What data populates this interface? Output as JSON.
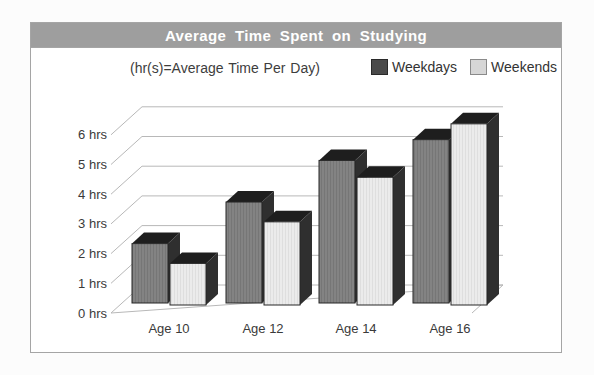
{
  "page": {
    "title_bar": "Average Time Spent on Studying",
    "subtitle": "(hr(s)=Average Time Per Day)"
  },
  "legend": {
    "items": [
      {
        "label": "Weekdays",
        "swatch_color": "#4a4a4a"
      },
      {
        "label": "Weekends",
        "swatch_color": "#d6d6d6"
      }
    ]
  },
  "chart_data": {
    "type": "bar",
    "projection": "pseudo-3d",
    "title": "Average Time Spent on Studying",
    "subtitle": "(hr(s)=Average Time Per Day)",
    "categories": [
      "Age 10",
      "Age 12",
      "Age 14",
      "Age 16"
    ],
    "series": [
      {
        "name": "Weekdays",
        "color": "#828282",
        "values": [
          2.0,
          3.4,
          4.8,
          5.5
        ]
      },
      {
        "name": "Weekends",
        "color": "#eaeaea",
        "values": [
          1.4,
          2.8,
          4.3,
          6.1
        ]
      }
    ],
    "ylabel_unit": "hrs",
    "y_ticks": [
      "0 hrs",
      "1 hrs",
      "2 hrs",
      "3 hrs",
      "4 hrs",
      "5 hrs",
      "6 hrs"
    ],
    "ylim": [
      0,
      6
    ],
    "grid": true,
    "legend_position": "top-right",
    "colors": {
      "title_bar_bg": "#9e9e9e",
      "title_text": "#ffffff",
      "gridline": "#b8b8b8",
      "bar_top_face": "#1e1e1e",
      "bar_side_face": "#2f2f2f"
    }
  }
}
